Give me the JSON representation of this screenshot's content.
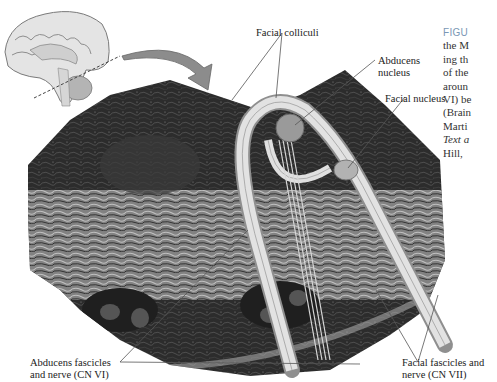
{
  "figure": {
    "labels": {
      "facial_colliculi": "Facial colliculi",
      "abducens_nucleus_line1": "Abducens",
      "abducens_nucleus_line2": "nucleus",
      "facial_nucleus": "Facial nucleus",
      "abducens_nerve_line1": "Abducens fascicles",
      "abducens_nerve_line2": "and nerve (CN VI)",
      "facial_nerve_line1": "Facial fascicles and",
      "facial_nerve_line2": "nerve (CN VII)"
    },
    "caption_lines": [
      "FIGU",
      "the M",
      "ing th",
      "of the",
      "aroun",
      "VI) be",
      "(Brain",
      "Marti",
      "Text a",
      "Hill, "
    ],
    "colors": {
      "tissue_dark": "#2a2a2a",
      "tissue_mid": "#6e6e6e",
      "nerve_fiber": "#d9d9d9",
      "nucleus_fill": "#9a9a9a",
      "arrow_fill": "#8c8c8c",
      "caption_head": "#7a97b5",
      "leader_line": "#555555"
    }
  }
}
